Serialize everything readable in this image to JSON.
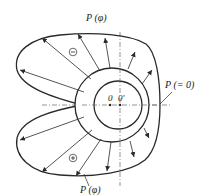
{
  "diagram": {
    "type": "journal-bearing-pressure-distribution",
    "labels": {
      "top_pressure": "P (φ)",
      "bottom_pressure": "P (φ)",
      "zero_pressure": "P (= 0)",
      "center_bearing": "0",
      "center_journal": "0'",
      "negative_region": "−",
      "positive_region": "+"
    },
    "colors": {
      "stroke": "#2a2a2a",
      "axis": "#555555",
      "background": "#ffffff"
    }
  }
}
